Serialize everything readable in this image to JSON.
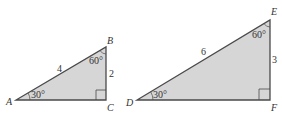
{
  "colors": {
    "fill": "#d6d6d6",
    "stroke": "#4a4a4a",
    "text": "#333333"
  },
  "triangles": [
    {
      "name": "ABC",
      "vertices": {
        "A": "A",
        "B": "B",
        "C": "C"
      },
      "hypotenuse_label": "4",
      "short_leg_label": "2",
      "angle_small": "30°",
      "angle_large": "60°",
      "right_angle_at": "C"
    },
    {
      "name": "DEF",
      "vertices": {
        "D": "D",
        "E": "E",
        "F": "F"
      },
      "hypotenuse_label": "6",
      "short_leg_label": "3",
      "angle_small": "30°",
      "angle_large": "60°",
      "right_angle_at": "F"
    }
  ]
}
